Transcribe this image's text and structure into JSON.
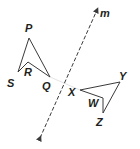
{
  "diagram": {
    "type": "reflection",
    "line": {
      "label": "m",
      "style": "dashed",
      "arrows": "both",
      "from": [
        40,
        138
      ],
      "to": [
        97,
        10
      ]
    },
    "preimage": {
      "name": "PQRS",
      "vertices": {
        "P": {
          "label": "P",
          "point": [
            29,
            38
          ],
          "label_pos": [
            25,
            32
          ]
        },
        "Q": {
          "label": "Q",
          "point": [
            50,
            77
          ],
          "label_pos": [
            42,
            90
          ]
        },
        "R": {
          "label": "R",
          "point": [
            28,
            62
          ],
          "label_pos": [
            24,
            76
          ]
        },
        "S": {
          "label": "S",
          "point": [
            18,
            72
          ],
          "label_pos": [
            7,
            87
          ]
        }
      }
    },
    "image": {
      "name": "XYZW",
      "vertices": {
        "X": {
          "label": "X",
          "point": [
            80,
            90
          ],
          "label_pos": [
            68,
            96
          ]
        },
        "Y": {
          "label": "Y",
          "point": [
            120,
            82
          ],
          "label_pos": [
            119,
            80
          ]
        },
        "Z": {
          "label": "Z",
          "point": [
            103,
            113
          ],
          "label_pos": [
            96,
            126
          ]
        },
        "W": {
          "label": "W",
          "point": [
            103,
            98
          ],
          "label_pos": [
            88,
            107
          ]
        }
      }
    },
    "colors": {
      "stroke": "#3a3a3a",
      "label": "#231f20",
      "connector": "#e4e4e4",
      "background": "#ffffff"
    }
  }
}
